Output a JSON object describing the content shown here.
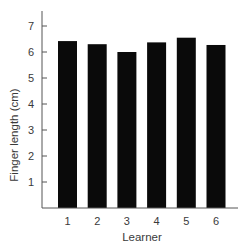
{
  "chart_data": {
    "type": "bar",
    "title": "",
    "xlabel": "Learner",
    "ylabel": "Finger length (cm)",
    "categories": [
      "1",
      "2",
      "3",
      "4",
      "5",
      "6"
    ],
    "values": [
      6.42,
      6.3,
      6.0,
      6.37,
      6.55,
      6.27
    ],
    "ylim": [
      0,
      7.5
    ],
    "yticks": [
      1,
      2,
      3,
      4,
      5,
      6,
      7
    ],
    "grid": false,
    "legend": null,
    "bar_color": "#0a0a0a",
    "axis_color": "#555555"
  }
}
